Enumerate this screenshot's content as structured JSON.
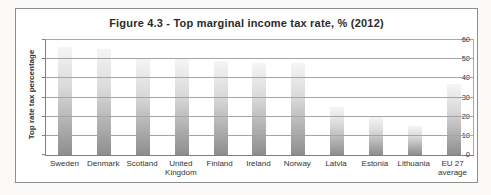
{
  "chart_data": {
    "type": "bar",
    "title": "Figure 4.3 - Top marginal income tax rate, % (2012)",
    "xlabel": "",
    "ylabel": "Top rate tax percentage",
    "ylim": [
      0,
      60
    ],
    "yticks": [
      0,
      10,
      20,
      30,
      40,
      50,
      60
    ],
    "grid": true,
    "gridlines_over_bars": true,
    "legend": "none",
    "categories": [
      "Sweden",
      "Denmark",
      "Scotland",
      "United Kingdom",
      "Finland",
      "Ireland",
      "Norway",
      "Latvia",
      "Estonia",
      "Lithuania",
      "EU 27 average"
    ],
    "values": [
      56.6,
      55.4,
      50,
      50,
      49,
      48,
      47.8,
      25,
      20,
      15,
      37
    ],
    "colors": {
      "bar_gradient_top": "#f5f5f5",
      "bar_gradient_bottom": "#8d8d8d",
      "gridline": "#a5a5a5",
      "axis": "#7f7f7f",
      "frame_border": "#8e8e8e",
      "text": "#333333",
      "background": "#ffffff"
    }
  }
}
